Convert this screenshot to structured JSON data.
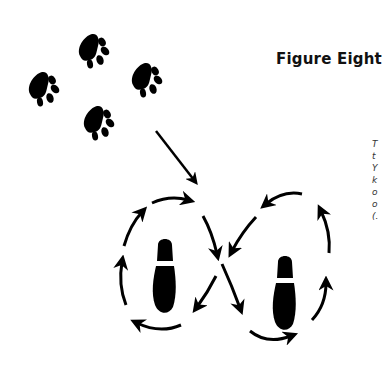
{
  "diagram": {
    "title": "Figure Eight",
    "caption_lines": [
      "T",
      "t",
      "Y",
      "k",
      "o",
      "o",
      "(."
    ],
    "elements": {
      "paw_prints": 4,
      "footprints": 2,
      "pattern": "figure-eight",
      "entry_arrow": "diagonal arrow from paw prints into crossing point"
    },
    "colors": {
      "ink": "#000000",
      "background": "#ffffff"
    }
  }
}
